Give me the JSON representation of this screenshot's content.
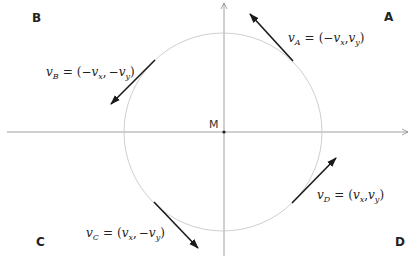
{
  "diagram": {
    "center_label": "M",
    "quadrants": {
      "A": "A",
      "B": "B",
      "C": "C",
      "D": "D"
    },
    "vectors": [
      {
        "id": "A",
        "name": "v",
        "sub": "A",
        "eq": "=",
        "open": "(",
        "first_sign": "−",
        "first": "v",
        "first_sub": "x",
        "sep": ",",
        "second_sign": "",
        "second": "v",
        "second_sub": "y",
        "close": ")",
        "direction": "up-left"
      },
      {
        "id": "B",
        "name": "v",
        "sub": "B",
        "eq": "=",
        "open": "(",
        "first_sign": "−",
        "first": "v",
        "first_sub": "x",
        "sep": ",",
        "second_sign": "−",
        "second": "v",
        "second_sub": "y",
        "close": ")",
        "direction": "down-left"
      },
      {
        "id": "C",
        "name": "v",
        "sub": "C",
        "eq": "=",
        "open": "(",
        "first_sign": "",
        "first": "v",
        "first_sub": "x",
        "sep": ",",
        "second_sign": "−",
        "second": "v",
        "second_sub": "y",
        "close": ")",
        "direction": "down-right"
      },
      {
        "id": "D",
        "name": "v",
        "sub": "D",
        "eq": "=",
        "open": "(",
        "first_sign": "",
        "first": "v",
        "first_sub": "x",
        "sep": ",",
        "second_sign": "",
        "second": "v",
        "second_sub": "y",
        "close": ")",
        "direction": "up-right"
      }
    ],
    "colors": {
      "axis": "#888888",
      "circle": "#c8c8c8",
      "arrow": "#1a1a1a",
      "text": "#222222"
    }
  }
}
